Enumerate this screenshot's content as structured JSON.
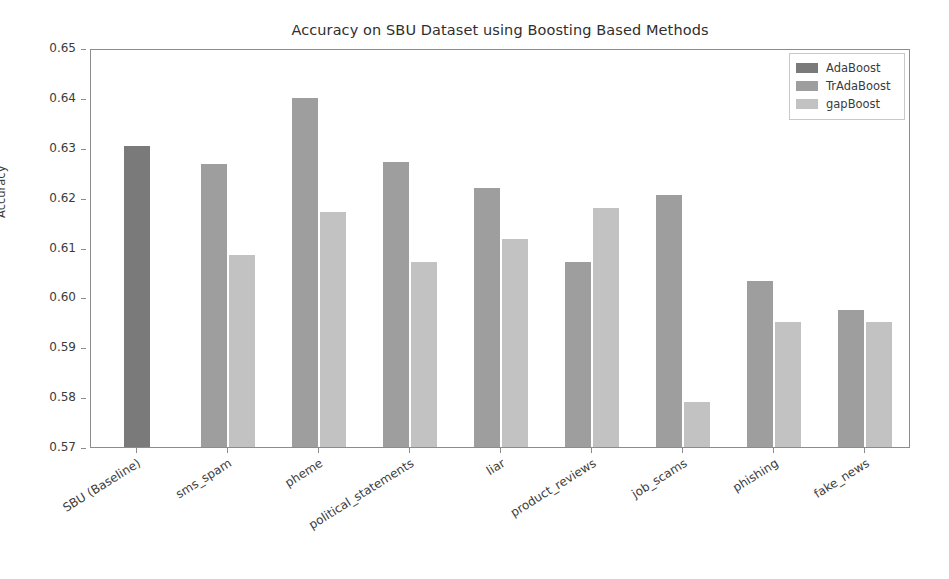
{
  "chart_data": {
    "type": "bar",
    "title": "Accuracy on SBU Dataset using Boosting Based Methods",
    "xlabel": "",
    "ylabel": "Accuracy",
    "ylim": [
      0.57,
      0.65
    ],
    "yticks": [
      "0.57",
      "0.58",
      "0.59",
      "0.60",
      "0.61",
      "0.62",
      "0.63",
      "0.64",
      "0.65"
    ],
    "ytick_values": [
      0.57,
      0.58,
      0.59,
      0.6,
      0.61,
      0.62,
      0.63,
      0.64,
      0.65
    ],
    "grid": false,
    "legend_position": "upper right",
    "categories": [
      "SBU (Baseline)",
      "sms_spam",
      "pheme",
      "political_statements",
      "liar",
      "product_reviews",
      "job_scams",
      "phishing",
      "fake_news"
    ],
    "series": [
      {
        "name": "AdaBoost",
        "color": "#7a7a7a",
        "values": [
          0.6303,
          null,
          null,
          null,
          null,
          null,
          null,
          null,
          null
        ]
      },
      {
        "name": "TrAdaBoost",
        "color": "#9e9e9e",
        "values": [
          null,
          0.6267,
          0.64,
          0.6272,
          0.622,
          0.607,
          0.6205,
          0.6033,
          0.5975
        ]
      },
      {
        "name": "gapBoost",
        "color": "#c2c2c2",
        "values": [
          null,
          0.6085,
          0.6172,
          0.607,
          0.6118,
          0.618,
          0.579,
          0.595,
          0.5951
        ]
      }
    ]
  },
  "legend": {
    "items": [
      {
        "label": "AdaBoost",
        "color": "#7a7a7a"
      },
      {
        "label": "TrAdaBoost",
        "color": "#9e9e9e"
      },
      {
        "label": "gapBoost",
        "color": "#c2c2c2"
      }
    ]
  }
}
